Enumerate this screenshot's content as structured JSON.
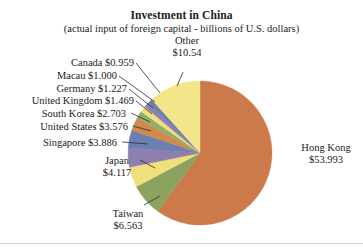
{
  "title": "Investment in China",
  "subtitle": "(actual input of foreign capital - billions of U.S. dollars)",
  "labels": {
    "other_name": "Other",
    "other_value": "$10.54",
    "canada": "Canada $0.959",
    "macau": "Macau $1.000",
    "germany": "Germany $1.227",
    "united_kingdom": "United Kingdom $1.469",
    "south_korea": "South Korea $2.703",
    "united_states": "United States $3.576",
    "singapore": "Singapore $3.886",
    "japan_name": "Japan",
    "japan_value": "$4.117",
    "taiwan_name": "Taiwan",
    "taiwan_value": "$6.563",
    "hong_kong_name": "Hong Kong",
    "hong_kong_value": "$53.993"
  },
  "chart_data": {
    "type": "pie",
    "title": "Investment in China",
    "subtitle": "(actual input of foreign capital - billions of U.S. dollars)",
    "unit": "billions of U.S. dollars",
    "xlabel": "",
    "ylabel": "",
    "grid": false,
    "legend_position": "none",
    "start_angle_deg": 0,
    "direction": "clockwise",
    "total": 89.833,
    "categories": [
      "Hong Kong",
      "Taiwan",
      "Japan",
      "Singapore",
      "United States",
      "South Korea",
      "United Kingdom",
      "Germany",
      "Macau",
      "Canada",
      "Other"
    ],
    "values": [
      53.993,
      6.563,
      4.117,
      3.886,
      3.576,
      2.703,
      1.469,
      1.227,
      1.0,
      0.959,
      10.54
    ],
    "value_labels": [
      "$53.993",
      "$6.563",
      "$4.117",
      "$3.886",
      "$3.576",
      "$2.703",
      "$1.469",
      "$1.227",
      "$1.000",
      "$0.959",
      "$10.54"
    ],
    "colors": [
      "#cc7a4a",
      "#8ba35f",
      "#efe07c",
      "#8e7fae",
      "#6b7fb0",
      "#d08a4e",
      "#8fae6a",
      "#efe07c",
      "#8e7fae",
      "#6b7fb0",
      "#f2e58a"
    ],
    "slices": [
      {
        "name": "Hong Kong",
        "value": 53.993,
        "label": "$53.993",
        "color": "#cc7a4a"
      },
      {
        "name": "Taiwan",
        "value": 6.563,
        "label": "$6.563",
        "color": "#8ba35f"
      },
      {
        "name": "Japan",
        "value": 4.117,
        "label": "$4.117",
        "color": "#efe07c"
      },
      {
        "name": "Singapore",
        "value": 3.886,
        "label": "$3.886",
        "color": "#8e7fae"
      },
      {
        "name": "United States",
        "value": 3.576,
        "label": "$3.576",
        "color": "#6b7fb0"
      },
      {
        "name": "South Korea",
        "value": 2.703,
        "label": "$2.703",
        "color": "#d08a4e"
      },
      {
        "name": "United Kingdom",
        "value": 1.469,
        "label": "$1.469",
        "color": "#8fae6a"
      },
      {
        "name": "Germany",
        "value": 1.227,
        "label": "$1.227",
        "color": "#efe07c"
      },
      {
        "name": "Macau",
        "value": 1.0,
        "label": "$1.000",
        "color": "#8e7fae"
      },
      {
        "name": "Canada",
        "value": 0.959,
        "label": "$0.959",
        "color": "#6b7fb0"
      },
      {
        "name": "Other",
        "value": 10.54,
        "label": "$10.54",
        "color": "#f2e58a"
      }
    ]
  }
}
